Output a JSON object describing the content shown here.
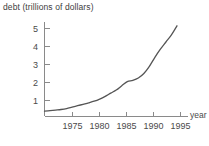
{
  "chart_data": {
    "type": "line",
    "title": "debt (trillions of dollars)",
    "xlabel": "year",
    "ylabel": "debt (trillions of dollars)",
    "xlim": [
      1971,
      1997
    ],
    "ylim": [
      0,
      5.6
    ],
    "grid": false,
    "legend": null,
    "xticks": [
      1975,
      1980,
      1985,
      1990,
      1995
    ],
    "xtick_labels": [
      "1975",
      "1980",
      "1985",
      "1990",
      "1995"
    ],
    "yticks": [
      1,
      2,
      3,
      4,
      5
    ],
    "ytick_labels": [
      "1",
      "2",
      "3",
      "4",
      "5"
    ],
    "series": [
      {
        "name": "federal debt",
        "x": [
          1971,
          1972,
          1973,
          1974,
          1975,
          1976,
          1977,
          1978,
          1979,
          1980,
          1981,
          1982,
          1983,
          1984,
          1985,
          1986,
          1987,
          1988,
          1989,
          1990,
          1991,
          1992,
          1993,
          1994,
          1995
        ],
        "values": [
          0.41,
          0.44,
          0.47,
          0.5,
          0.55,
          0.63,
          0.71,
          0.79,
          0.87,
          0.96,
          1.08,
          1.23,
          1.41,
          1.58,
          1.82,
          2.05,
          2.12,
          2.25,
          2.5,
          2.9,
          3.4,
          3.85,
          4.25,
          4.65,
          5.15
        ]
      }
    ]
  },
  "axis_labels": {
    "x_axis_name": "year",
    "y_tick_1": "1",
    "y_tick_2": "2",
    "y_tick_3": "3",
    "y_tick_4": "4",
    "y_tick_5": "5",
    "x_tick_1975": "1975",
    "x_tick_1980": "1980",
    "x_tick_1985": "1985",
    "x_tick_1990": "1990",
    "x_tick_1995": "1995"
  },
  "colors": {
    "curve": "#555555",
    "axis": "#8a8a8a",
    "text": "#4a4a4a",
    "background": "#ffffff"
  }
}
